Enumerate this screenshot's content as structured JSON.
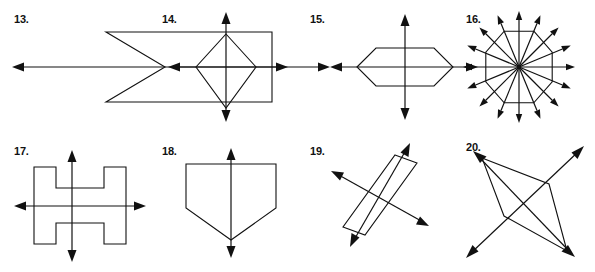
{
  "worksheet": {
    "title": "Lines of Symmetry Exercises 13-20",
    "line_color": "#111111",
    "background_color": "#ffffff",
    "stroke_width": 1.1
  },
  "figures": [
    {
      "number": "13.",
      "label_x": 14,
      "label_y": 14,
      "shape_name": "chevron-arrow-pentagon",
      "lines_of_symmetry": 1,
      "symmetry_axes": [
        "horizontal"
      ],
      "shape_points": "106,32 272,32 272,102 106,102 165,67",
      "axes": [
        {
          "name": "horizontal",
          "x1": 12,
          "y1": 67,
          "x2": 330,
          "y2": 67,
          "arrows": "both"
        }
      ]
    },
    {
      "number": "14.",
      "label_x": 162,
      "label_y": 14,
      "shape_name": "kite-rhombus",
      "lines_of_symmetry": 2,
      "symmetry_axes": [
        "vertical",
        "horizontal"
      ],
      "shape_points": "226,34 256,67 226,108 196,67",
      "axes": [
        {
          "name": "vertical",
          "x1": 226,
          "y1": 12,
          "x2": 226,
          "y2": 122,
          "arrows": "both"
        },
        {
          "name": "horizontal",
          "x1": 168,
          "y1": 67,
          "x2": 288,
          "y2": 67,
          "arrows": "both"
        }
      ]
    },
    {
      "number": "15.",
      "label_x": 310,
      "label_y": 14,
      "shape_name": "elongated-hexagon",
      "lines_of_symmetry": 2,
      "symmetry_axes": [
        "vertical",
        "horizontal"
      ],
      "shape_points": "357,67 376,48 434,48 453,67 434,86 376,86",
      "axes": [
        {
          "name": "vertical",
          "x1": 405,
          "y1": 14,
          "x2": 405,
          "y2": 120,
          "arrows": "both"
        },
        {
          "name": "horizontal",
          "x1": 330,
          "y1": 67,
          "x2": 478,
          "y2": 67,
          "arrows": "both"
        }
      ]
    },
    {
      "number": "16.",
      "label_x": 466,
      "label_y": 14,
      "shape_name": "regular-octagon",
      "lines_of_symmetry": 8,
      "symmetry_axes": [
        "horizontal",
        "vertical",
        "diagonal-45",
        "diagonal-135",
        "vertex-axes"
      ],
      "center_x": 519,
      "center_y": 67,
      "radius": 36,
      "axis_length": 56,
      "axes": [
        {
          "name": "angle-0",
          "angle_deg": 0,
          "arrows": "both"
        },
        {
          "name": "angle-45",
          "angle_deg": 45,
          "arrows": "both"
        },
        {
          "name": "angle-90",
          "angle_deg": 90,
          "arrows": "both"
        },
        {
          "name": "angle-135",
          "angle_deg": 135,
          "arrows": "both"
        },
        {
          "name": "angle-22",
          "angle_deg": 22.5,
          "arrows": "both"
        },
        {
          "name": "angle-67",
          "angle_deg": 67.5,
          "arrows": "both"
        },
        {
          "name": "angle-112",
          "angle_deg": 112.5,
          "arrows": "both"
        },
        {
          "name": "angle-157",
          "angle_deg": 157.5,
          "arrows": "both"
        }
      ]
    },
    {
      "number": "17.",
      "label_x": 14,
      "label_y": 146,
      "shape_name": "i-beam-h-shape",
      "lines_of_symmetry": 2,
      "symmetry_axes": [
        "vertical",
        "horizontal"
      ],
      "shape_points": "34,167 56,167 56,188 104,188 104,167 126,167 126,244 104,244 104,223 56,223 56,244 34,244",
      "axes": [
        {
          "name": "vertical",
          "x1": 72,
          "y1": 150,
          "x2": 72,
          "y2": 262,
          "arrows": "both"
        },
        {
          "name": "horizontal",
          "x1": 14,
          "y1": 206,
          "x2": 146,
          "y2": 206,
          "arrows": "both"
        }
      ]
    },
    {
      "number": "18.",
      "label_x": 162,
      "label_y": 146,
      "shape_name": "home-plate-pentagon",
      "lines_of_symmetry": 1,
      "symmetry_axes": [
        "vertical"
      ],
      "shape_points": "186,164 276,164 276,208 231,240 186,208",
      "axes": [
        {
          "name": "vertical",
          "x1": 231,
          "y1": 148,
          "x2": 231,
          "y2": 258,
          "arrows": "both"
        }
      ]
    },
    {
      "number": "19.",
      "label_x": 310,
      "label_y": 146,
      "shape_name": "tilted-rectangle",
      "lines_of_symmetry": 2,
      "symmetry_axes": [
        "long-axis",
        "short-axis"
      ],
      "shape_points": "395,155 417,163 365,235 343,227",
      "axes": [
        {
          "name": "long-axis",
          "x1": 408,
          "y1": 146,
          "x2": 352,
          "y2": 244,
          "arrows": "both"
        },
        {
          "name": "short-axis",
          "x1": 332,
          "y1": 172,
          "x2": 428,
          "y2": 225,
          "arrows": "both"
        }
      ]
    },
    {
      "number": "20.",
      "label_x": 466,
      "label_y": 142,
      "shape_name": "kite-quadrilateral-diagonals",
      "lines_of_symmetry": 2,
      "symmetry_axes": [
        "diagonal-1",
        "diagonal-2"
      ],
      "shape_points": "482,158 549,184 567,251 504,216",
      "axes": [
        {
          "name": "diagonal-1",
          "x1": 474,
          "y1": 153,
          "x2": 574,
          "y2": 256,
          "arrows": "both"
        },
        {
          "name": "diagonal-2",
          "x1": 583,
          "y1": 147,
          "x2": 466,
          "y2": 258,
          "arrows": "both"
        }
      ]
    }
  ]
}
